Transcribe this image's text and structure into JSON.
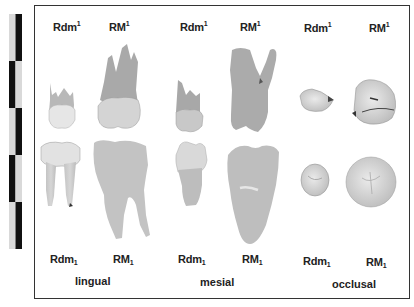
{
  "figure": {
    "scale_bar": {
      "segments": 5,
      "colors": [
        "#d8d8d8",
        "#111111"
      ]
    },
    "top_row_labels": [
      {
        "base": "Rdm",
        "sup": "1"
      },
      {
        "base": "RM",
        "sup": "1"
      },
      {
        "base": "Rdm",
        "sup": "1"
      },
      {
        "base": "RM",
        "sup": "1"
      },
      {
        "base": "Rdm",
        "sup": "1"
      },
      {
        "base": "RM",
        "sup": "1"
      }
    ],
    "bottom_row_labels": [
      {
        "base": "Rdm",
        "sub": "1"
      },
      {
        "base": "RM",
        "sub": "1"
      },
      {
        "base": "Rdm",
        "sub": "1"
      },
      {
        "base": "RM",
        "sub": "1"
      },
      {
        "base": "Rdm",
        "sub": "1"
      },
      {
        "base": "RM",
        "sub": "1"
      }
    ],
    "views": [
      "lingual",
      "mesial",
      "occlusal"
    ]
  }
}
